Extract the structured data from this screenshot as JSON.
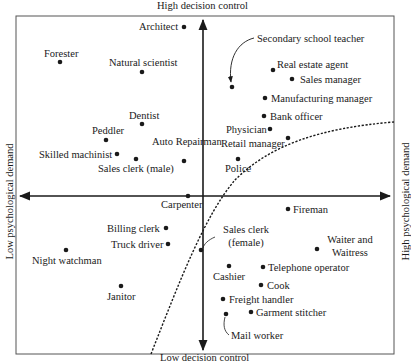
{
  "chart_data": {
    "type": "scatter",
    "title": "",
    "axes": {
      "top": "High decision control",
      "bottom": "Low decision control",
      "left": "Low psychological demand",
      "right": "High psychological demand"
    },
    "x_meaning": "psychological demand (low → high)",
    "y_meaning": "decision control (low → high)",
    "grid": false,
    "points": [
      {
        "label": "Architect",
        "x": 184,
        "y": 27
      },
      {
        "label": "Forester",
        "x": 60,
        "y": 62
      },
      {
        "label": "Natural scientist",
        "x": 142,
        "y": 72
      },
      {
        "label": "Secondary school teacher",
        "x": 232,
        "y": 87
      },
      {
        "label": "Real estate agent",
        "x": 273,
        "y": 70
      },
      {
        "label": "Sales manager",
        "x": 292,
        "y": 79
      },
      {
        "label": "Manufacturing manager",
        "x": 265,
        "y": 98
      },
      {
        "label": "Bank officer",
        "x": 264,
        "y": 116
      },
      {
        "label": "Dentist",
        "x": 142,
        "y": 124
      },
      {
        "label": "Peddler",
        "x": 106,
        "y": 140
      },
      {
        "label": "Physician",
        "x": 270,
        "y": 129
      },
      {
        "label": "Retail manager",
        "x": 288,
        "y": 138
      },
      {
        "label": "Skilled machinist",
        "x": 117,
        "y": 154
      },
      {
        "label": "Sales clerk (male)",
        "x": 136,
        "y": 159
      },
      {
        "label": "Auto Repairman",
        "x": 184,
        "y": 161
      },
      {
        "label": "Police",
        "x": 238,
        "y": 159
      },
      {
        "label": "Carpenter",
        "x": 188,
        "y": 196
      },
      {
        "label": "Fireman",
        "x": 288,
        "y": 209
      },
      {
        "label": "Billing clerk",
        "x": 166,
        "y": 228
      },
      {
        "label": "Truck driver",
        "x": 168,
        "y": 244
      },
      {
        "label": "Sales clerk (female)",
        "x": 201,
        "y": 250
      },
      {
        "label": "Night watchman",
        "x": 66,
        "y": 250
      },
      {
        "label": "Waiter and Waitress",
        "x": 317,
        "y": 249
      },
      {
        "label": "Cashier",
        "x": 229,
        "y": 266
      },
      {
        "label": "Telephone operator",
        "x": 263,
        "y": 267
      },
      {
        "label": "Janitor",
        "x": 121,
        "y": 286
      },
      {
        "label": "Cook",
        "x": 261,
        "y": 285
      },
      {
        "label": "Freight handler",
        "x": 223,
        "y": 299
      },
      {
        "label": "Garment stitcher",
        "x": 251,
        "y": 312
      },
      {
        "label": "Mail worker",
        "x": 226,
        "y": 314
      }
    ],
    "curve": {
      "style": "dashed",
      "description": "Boundary curve rising from bottom-center to upper-right"
    }
  }
}
